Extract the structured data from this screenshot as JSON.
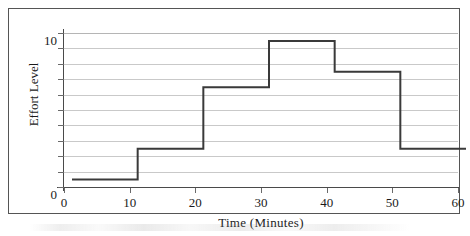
{
  "chart_data": {
    "type": "line",
    "subtype": "step",
    "title": "",
    "xlabel": "Time  (Minutes)",
    "ylabel": "Effort Level",
    "x": [
      0,
      10,
      20,
      30,
      40,
      50,
      60
    ],
    "xlim": [
      0,
      60
    ],
    "ylim": [
      0,
      10
    ],
    "xticks": [
      0,
      10,
      20,
      30,
      40,
      50,
      60
    ],
    "xtick_labels": [
      "0",
      "10",
      "20",
      "30",
      "40",
      "50",
      "60"
    ],
    "yticks": [
      0,
      1,
      2,
      3,
      4,
      5,
      6,
      7,
      8,
      9,
      10
    ],
    "ytick_labels": [
      "0",
      "",
      "",
      "",
      "",
      "",
      "",
      "",
      "",
      "",
      "10"
    ],
    "y_labeled_ticks": [
      {
        "value": 10,
        "label": "10"
      },
      {
        "value": 0,
        "label": "0"
      }
    ],
    "grid": true,
    "grid_axis": "y",
    "grid_color": "#c9c9c9",
    "legend": false,
    "series": [
      {
        "name": "Effort Level",
        "color": "#3a3a3a",
        "line_width": 2,
        "step_mode": "post",
        "intervals": [
          {
            "x_start": 0,
            "x_end": 10,
            "value": 1
          },
          {
            "x_start": 10,
            "x_end": 20,
            "value": 3
          },
          {
            "x_start": 20,
            "x_end": 30,
            "value": 7
          },
          {
            "x_start": 30,
            "x_end": 40,
            "value": 10
          },
          {
            "x_start": 40,
            "x_end": 50,
            "value": 8
          },
          {
            "x_start": 50,
            "x_end": 60,
            "value": 3
          }
        ],
        "values": [
          1,
          3,
          7,
          10,
          8,
          3,
          3
        ]
      }
    ]
  },
  "figure": {
    "border_color": "#555555",
    "background": "#ffffff",
    "axis_color": "#4a4a4a"
  }
}
